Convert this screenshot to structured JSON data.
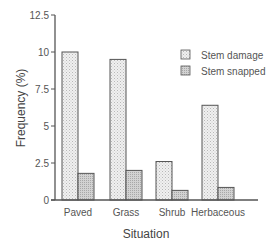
{
  "chart_data": {
    "type": "bar",
    "title": "",
    "xlabel": "Situation",
    "ylabel": "Frequency (%)",
    "ylim": [
      0,
      12.5
    ],
    "yticks": [
      "0",
      "2.5",
      "5",
      "7.5",
      "10",
      "12.5"
    ],
    "grid": false,
    "legend_position": "upper right",
    "categories": [
      "Paved",
      "Grass",
      "Shrub",
      "Herbaceous"
    ],
    "series": [
      {
        "name": "Stem damage",
        "values": [
          10.0,
          9.5,
          2.6,
          6.4
        ],
        "fill": "#e8e8e8"
      },
      {
        "name": "Stem snapped",
        "values": [
          1.8,
          2.0,
          0.65,
          0.85
        ],
        "fill": "#c8c8c8"
      }
    ]
  },
  "colors": {
    "axis": "#555555",
    "bar_stroke": "#555555"
  }
}
